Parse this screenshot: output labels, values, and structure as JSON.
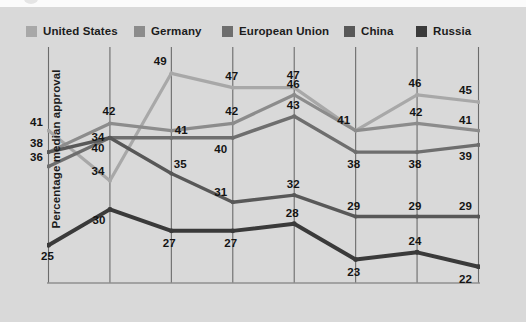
{
  "legend": {
    "items": [
      {
        "label": "United States",
        "color": "#a8a8a8",
        "x": 26
      },
      {
        "label": "Germany",
        "color": "#8c8c8c",
        "x": 134
      },
      {
        "label": "European Union",
        "color": "#6e6e6e",
        "x": 222
      },
      {
        "label": "China",
        "color": "#585858",
        "x": 344
      },
      {
        "label": "Russia",
        "color": "#3a3a3a",
        "x": 416
      }
    ]
  },
  "chart_data": {
    "type": "line",
    "title": "",
    "xlabel": "",
    "ylabel": "Percentage median approval",
    "categories": [
      "2007",
      "2008",
      "2009",
      "2010",
      "2011",
      "2012",
      "2013",
      "2014"
    ],
    "x": [
      2007,
      2008,
      2009,
      2010,
      2011,
      2012,
      2013,
      2014
    ],
    "ylim": [
      20,
      51
    ],
    "xlim": [
      2007,
      2014
    ],
    "grid": "vertical-only",
    "legend_position": "top",
    "series": [
      {
        "name": "United States",
        "color": "#a8a8a8",
        "width": 3.2,
        "values": [
          41,
          34,
          49,
          47,
          47,
          41,
          46,
          45
        ],
        "labels": [
          {
            "text": "41",
            "dx": -12,
            "dy": -9
          },
          {
            "text": "34",
            "dx": -12,
            "dy": -10
          },
          {
            "text": "49",
            "dx": -11,
            "dy": -12
          },
          {
            "text": "47",
            "dx": -1,
            "dy": -12
          },
          {
            "text": "47",
            "dx": -1,
            "dy": -13
          },
          {
            "text": "41",
            "dx": -12,
            "dy": -11
          },
          {
            "text": "46",
            "dx": -2,
            "dy": -12
          },
          {
            "text": "45",
            "dx": -13,
            "dy": -12
          }
        ]
      },
      {
        "name": "Germany",
        "color": "#8c8c8c",
        "width": 3.2,
        "values": [
          38,
          42,
          41,
          42,
          46,
          41,
          42,
          41
        ],
        "labels": [
          {
            "text": "38",
            "dx": -12,
            "dy": -9
          },
          {
            "text": "42",
            "dx": -1,
            "dy": -12
          },
          {
            "text": "41",
            "dx": 10,
            "dy": -1
          },
          {
            "text": "42",
            "dx": -1,
            "dy": -12
          },
          {
            "text": "46",
            "dx": -1,
            "dy": -11
          },
          {
            "text": null,
            "dx": 0,
            "dy": 0
          },
          {
            "text": "42",
            "dx": -1,
            "dy": -11
          },
          {
            "text": "41",
            "dx": -13,
            "dy": -11
          }
        ]
      },
      {
        "name": "European Union",
        "color": "#6e6e6e",
        "width": 3.4,
        "values": [
          36,
          40,
          40,
          40,
          43,
          38,
          38,
          39
        ],
        "labels": [
          {
            "text": "36",
            "dx": -12,
            "dy": -9
          },
          {
            "text": "40",
            "dx": -12,
            "dy": 10
          },
          {
            "text": null,
            "dx": 0,
            "dy": 0
          },
          {
            "text": "40",
            "dx": -12,
            "dy": 11
          },
          {
            "text": "43",
            "dx": -1,
            "dy": -11
          },
          {
            "text": "38",
            "dx": -2,
            "dy": 12
          },
          {
            "text": "38",
            "dx": -2,
            "dy": 12
          },
          {
            "text": "39",
            "dx": -13,
            "dy": 11
          }
        ]
      },
      {
        "name": "China",
        "color": "#585858",
        "width": 3.4,
        "values": [
          38,
          40,
          35,
          31,
          32,
          29,
          29,
          29
        ],
        "labels": [
          {
            "text": null,
            "dx": 0,
            "dy": 0
          },
          {
            "text": "34",
            "dx": -12,
            "dy": -1
          },
          {
            "text": "35",
            "dx": 9,
            "dy": -10
          },
          {
            "text": "31",
            "dx": -12,
            "dy": -10
          },
          {
            "text": "32",
            "dx": -1,
            "dy": -11
          },
          {
            "text": "29",
            "dx": -2,
            "dy": -11
          },
          {
            "text": "29",
            "dx": -2,
            "dy": -11
          },
          {
            "text": "29",
            "dx": -13,
            "dy": -11
          }
        ]
      },
      {
        "name": "Russia",
        "color": "#3a3a3a",
        "width": 4.0,
        "values": [
          25,
          30,
          27,
          27,
          28,
          23,
          24,
          22
        ],
        "labels": [
          {
            "text": "25",
            "dx": -1,
            "dy": 11
          },
          {
            "text": "30",
            "dx": -11,
            "dy": 11
          },
          {
            "text": "27",
            "dx": -2,
            "dy": 12
          },
          {
            "text": "27",
            "dx": -2,
            "dy": 12
          },
          {
            "text": "28",
            "dx": -2,
            "dy": -11
          },
          {
            "text": "23",
            "dx": -2,
            "dy": 12
          },
          {
            "text": "24",
            "dx": -2,
            "dy": -11
          },
          {
            "text": "22",
            "dx": -13,
            "dy": 12
          }
        ]
      }
    ]
  },
  "axis": {
    "gridline_color": "#6b6b6b",
    "baseline_color": "#8f8f8f"
  }
}
